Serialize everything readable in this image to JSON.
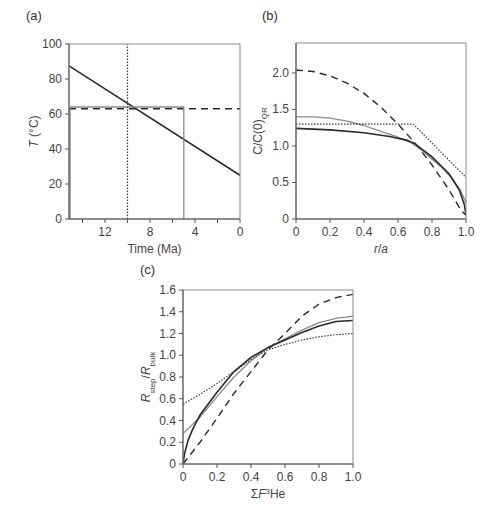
{
  "chart_data": [
    {
      "panel": "(a)",
      "type": "line",
      "xlabel": "Time (Ma)",
      "ylabel": "T (°C)",
      "xlim": [
        15.2,
        0
      ],
      "ylim": [
        0,
        100
      ],
      "xticks": [
        12,
        8,
        4,
        0
      ],
      "xminor": [
        14,
        10,
        6,
        2
      ],
      "yticks": [
        0,
        20,
        40,
        60,
        80,
        100
      ],
      "grid": false,
      "series": [
        {
          "name": "linear cooling",
          "style": "solid-black",
          "x": [
            15.2,
            0
          ],
          "y": [
            87.5,
            25
          ]
        },
        {
          "name": "isothermal",
          "style": "dashed-black",
          "x": [
            15.2,
            0
          ],
          "y": [
            63,
            63
          ]
        },
        {
          "name": "step (gray)",
          "style": "solid-gray",
          "x": [
            15.1,
            15.1,
            5,
            5
          ],
          "y": [
            0,
            64,
            64,
            0
          ]
        },
        {
          "name": "instant at 10 Ma",
          "style": "dotted-black",
          "x": [
            10,
            10
          ],
          "y": [
            0,
            100
          ]
        }
      ]
    },
    {
      "panel": "(b)",
      "type": "line",
      "xlabel": "r/a",
      "ylabel": "C/C(0)QR",
      "ylabel_main": "C/C(0)",
      "ylabel_sub": "QR",
      "xlim": [
        0,
        1.0
      ],
      "ylim": [
        0,
        2.41
      ],
      "xticks": [
        0,
        0.2,
        0.4,
        0.6,
        0.8,
        1.0
      ],
      "yticks": [
        0,
        0.5,
        1.0,
        1.5,
        2.0
      ],
      "grid": false,
      "series": [
        {
          "name": "dashed",
          "style": "dashed-black",
          "x": [
            0,
            0.1,
            0.2,
            0.3,
            0.4,
            0.5,
            0.6,
            0.7,
            0.8,
            0.9,
            0.97,
            1.0
          ],
          "y": [
            2.04,
            2.02,
            1.96,
            1.86,
            1.72,
            1.53,
            1.3,
            1.04,
            0.74,
            0.4,
            0.12,
            0.05
          ]
        },
        {
          "name": "gray solid",
          "style": "solid-gray",
          "x": [
            0,
            0.1,
            0.2,
            0.3,
            0.4,
            0.5,
            0.6,
            0.68,
            0.75,
            0.85,
            0.92,
            0.97,
            1.0
          ],
          "y": [
            1.4,
            1.4,
            1.38,
            1.34,
            1.28,
            1.2,
            1.12,
            1.04,
            0.92,
            0.72,
            0.55,
            0.38,
            0.22
          ]
        },
        {
          "name": "dotted",
          "style": "dotted-black",
          "x": [
            0,
            0.69,
            1.0
          ],
          "y": [
            1.3,
            1.3,
            0.57
          ]
        },
        {
          "name": "black solid",
          "style": "solid-black",
          "x": [
            0,
            0.2,
            0.4,
            0.55,
            0.65,
            0.7,
            0.8,
            0.9,
            0.96,
            0.99,
            1.0
          ],
          "y": [
            1.24,
            1.22,
            1.18,
            1.13,
            1.08,
            1.03,
            0.85,
            0.62,
            0.4,
            0.2,
            0.05
          ]
        }
      ]
    },
    {
      "panel": "(c)",
      "type": "line",
      "xlabel": "ΣF3He",
      "xlabel_prefix": "ΣF",
      "xlabel_sup": "3",
      "xlabel_suffix": "He",
      "ylabel": "Rstep/Rbulk",
      "xlim": [
        0,
        1.0
      ],
      "ylim": [
        0,
        1.6
      ],
      "xticks": [
        0,
        0.2,
        0.4,
        0.6,
        0.8,
        1.0
      ],
      "yticks": [
        0,
        0.2,
        0.4,
        0.6,
        0.8,
        1.0,
        1.2,
        1.4,
        1.6
      ],
      "grid": false,
      "series": [
        {
          "name": "dashed",
          "style": "dashed-black",
          "x": [
            0,
            0.1,
            0.2,
            0.3,
            0.4,
            0.5,
            0.6,
            0.7,
            0.8,
            0.9,
            1.0
          ],
          "y": [
            0,
            0.2,
            0.42,
            0.65,
            0.85,
            1.05,
            1.2,
            1.36,
            1.47,
            1.53,
            1.56
          ]
        },
        {
          "name": "gray solid",
          "style": "solid-gray",
          "x": [
            0,
            0.1,
            0.2,
            0.3,
            0.4,
            0.5,
            0.6,
            0.7,
            0.8,
            0.9,
            1.0
          ],
          "y": [
            0.28,
            0.43,
            0.62,
            0.8,
            0.95,
            1.07,
            1.15,
            1.23,
            1.3,
            1.34,
            1.36
          ]
        },
        {
          "name": "dotted",
          "style": "dotted-black",
          "x": [
            0,
            0.1,
            0.2,
            0.3,
            0.4,
            0.5,
            0.6,
            0.7,
            0.8,
            0.9,
            1.0
          ],
          "y": [
            0.55,
            0.64,
            0.74,
            0.85,
            0.96,
            1.05,
            1.1,
            1.14,
            1.17,
            1.19,
            1.2
          ]
        },
        {
          "name": "black solid",
          "style": "solid-black",
          "x": [
            0,
            0.01,
            0.03,
            0.06,
            0.1,
            0.2,
            0.3,
            0.4,
            0.5,
            0.6,
            0.7,
            0.8,
            0.9,
            1.0
          ],
          "y": [
            0,
            0.1,
            0.22,
            0.33,
            0.45,
            0.66,
            0.85,
            0.98,
            1.07,
            1.14,
            1.21,
            1.27,
            1.31,
            1.32
          ]
        }
      ]
    }
  ],
  "labels": {
    "panel_a": "(a)",
    "panel_b": "(b)",
    "panel_c": "(c)"
  }
}
